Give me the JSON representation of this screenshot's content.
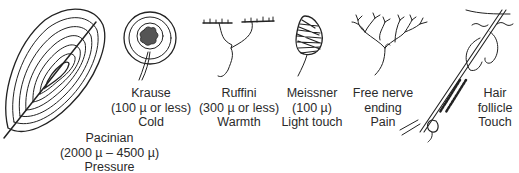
{
  "receptors": [
    {
      "id": "pacinian",
      "name": "Pacinian",
      "size": "(2000 µ – 4500 µ)",
      "sensation": "Pressure"
    },
    {
      "id": "krause",
      "name": "Krause",
      "size": "(100 µ or less)",
      "sensation": "Cold"
    },
    {
      "id": "ruffini",
      "name": "Ruffini",
      "size": "(300 µ or less)",
      "sensation": "Warmth"
    },
    {
      "id": "meissner",
      "name": "Meissner",
      "size": "(100 µ)",
      "sensation": "Light touch"
    },
    {
      "id": "free-nerve",
      "name": "Free nerve",
      "size": "ending",
      "sensation": "Pain"
    },
    {
      "id": "hair-follicle",
      "name": "Hair",
      "size": "follicle",
      "sensation": "Touch"
    }
  ],
  "colors": {
    "ink": "#222222",
    "background": "#ffffff"
  }
}
